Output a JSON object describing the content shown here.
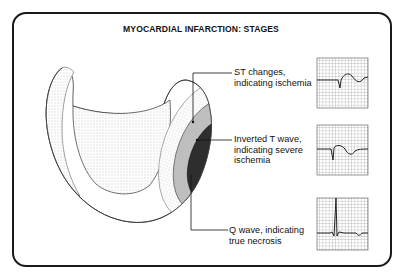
{
  "diagram": {
    "title": "MYOCARDIAL INFARCTION: STAGES",
    "stages": [
      {
        "name": "st-changes",
        "label_line1": "ST changes,",
        "label_line2": "indicating ischemia",
        "label_line3": "",
        "ecg": "ST segment change"
      },
      {
        "name": "inverted-t-wave",
        "label_line1": "Inverted T wave,",
        "label_line2": "indicating severe",
        "label_line3": "ischemia",
        "ecg": "inverted T wave"
      },
      {
        "name": "q-wave",
        "label_line1": "Q wave, indicating",
        "label_line2": "true necrosis",
        "label_line3": "",
        "ecg": "pathologic Q wave"
      }
    ],
    "zone_colors": {
      "ischemia": "#d8d8d8",
      "injury": "#8a8a8a",
      "necrosis": "#2e2e2e"
    }
  }
}
